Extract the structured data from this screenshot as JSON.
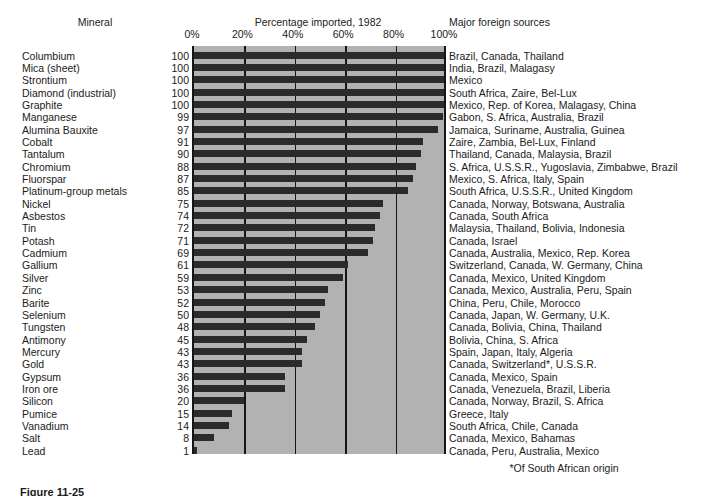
{
  "headers": {
    "mineral": "Mineral",
    "percentage": "Percentage imported, 1982",
    "sources": "Major foreign sources"
  },
  "footnote": "*Of South African origin",
  "figure_caption": "Figure 11-25",
  "colors": {
    "plot_background": "#b2b2b2",
    "bar": "#2b2b2b",
    "gridline": "#161616",
    "text": "#1b1b1b",
    "page_background": "#ffffff"
  },
  "chart_data": {
    "type": "bar",
    "orientation": "horizontal",
    "title": "Percentage imported, 1982",
    "xlabel": "Percentage imported, 1982",
    "ylabel": "Mineral",
    "xlim": [
      0,
      100
    ],
    "grid": true,
    "legend": "none",
    "tick_labels": [
      "0%",
      "20%",
      "40%",
      "60%",
      "80%",
      "100%"
    ],
    "tick_values": [
      0,
      20,
      40,
      60,
      80,
      100
    ],
    "categories": [
      "Columbium",
      "Mica (sheet)",
      "Strontium",
      "Diamond (industrial)",
      "Graphite",
      "Manganese",
      "Alumina Bauxite",
      "Cobalt",
      "Tantalum",
      "Chromium",
      "Fluorspar",
      "Platinum-group metals",
      "Nickel",
      "Asbestos",
      "Tin",
      "Potash",
      "Cadmium",
      "Gallium",
      "Silver",
      "Zinc",
      "Barite",
      "Selenium",
      "Tungsten",
      "Antimony",
      "Mercury",
      "Gold",
      "Gypsum",
      "Iron ore",
      "Silicon",
      "Pumice",
      "Vanadium",
      "Salt",
      "Lead"
    ],
    "values": [
      100,
      100,
      100,
      100,
      100,
      99,
      97,
      91,
      90,
      88,
      87,
      85,
      75,
      74,
      72,
      71,
      69,
      61,
      59,
      53,
      52,
      50,
      48,
      45,
      43,
      43,
      36,
      36,
      20,
      15,
      14,
      8,
      1
    ],
    "sources": [
      "Brazil, Canada, Thailand",
      "India, Brazil, Malagasy",
      "Mexico",
      "South Africa, Zaire, Bel-Lux",
      "Mexico, Rep. of Korea, Malagasy, China",
      "Gabon, S. Africa, Australia, Brazil",
      "Jamaica, Suriname, Australia, Guinea",
      "Zaire, Zambia, Bel-Lux, Finland",
      "Thailand, Canada, Malaysia, Brazil",
      "S. Africa, U.S.S.R., Yugoslavia, Zimbabwe, Brazil",
      "Mexico, S. Africa, Italy, Spain",
      "South Africa, U.S.S.R., United Kingdom",
      "Canada, Norway, Botswana, Australia",
      "Canada, South Africa",
      "Malaysia, Thailand, Bolivia, Indonesia",
      "Canada, Israel",
      "Canada, Australia, Mexico, Rep. Korea",
      "Switzerland, Canada, W. Germany, China",
      "Canada, Mexico, United Kingdom",
      "Canada, Mexico, Australia, Peru, Spain",
      "China, Peru, Chile, Morocco",
      "Canada, Japan, W. Germany, U.K.",
      "Canada, Bolivia, China, Thailand",
      "Bolivia, China, S. Africa",
      "Spain, Japan, Italy, Algeria",
      "Canada, Switzerland*, U.S.S.R.",
      "Canada, Mexico, Spain",
      "Canada, Venezuela, Brazil, Liberia",
      "Canada, Norway, Brazil, S. Africa",
      "Greece, Italy",
      "South Africa, Chile, Canada",
      "Canada, Mexico, Bahamas",
      "Canada, Peru, Australia, Mexico"
    ]
  }
}
